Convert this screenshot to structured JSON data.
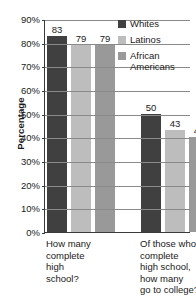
{
  "chart_data": {
    "type": "bar",
    "title": "",
    "xlabel": "",
    "ylabel": "Percentage",
    "ylim": [
      0,
      90
    ],
    "ytick_values": [
      0,
      10,
      20,
      30,
      40,
      50,
      60,
      70,
      80,
      90
    ],
    "ytick_labels": [
      "0%",
      "10%",
      "20%",
      "30%",
      "40%",
      "50%",
      "60%",
      "70%",
      "80%",
      "90%"
    ],
    "grid": true,
    "legend_position": "top-right",
    "categories": [
      "How many complete high school?",
      "Of those who complete high school, how many go to college?"
    ],
    "category_lines": [
      [
        "How many",
        "complete",
        "high",
        "school?"
      ],
      [
        "Of those who",
        "complete",
        "high school,",
        "how many",
        "go to college?"
      ]
    ],
    "series": [
      {
        "name": "Whites",
        "color": "#404040",
        "values": [
          83,
          50
        ]
      },
      {
        "name": "Latinos",
        "color": "#bdbdbd",
        "values": [
          79,
          43
        ]
      },
      {
        "name": "African Americans",
        "color": "#999999",
        "values": [
          79,
          40
        ]
      }
    ],
    "data_labels": [
      "83",
      "79",
      "79",
      "50",
      "43",
      "40"
    ]
  },
  "legend": {
    "items": [
      {
        "label": "Whites",
        "color": "#404040"
      },
      {
        "label": "Latinos",
        "color": "#bdbdbd"
      },
      {
        "label": "African Americans",
        "color": "#999999"
      }
    ]
  }
}
